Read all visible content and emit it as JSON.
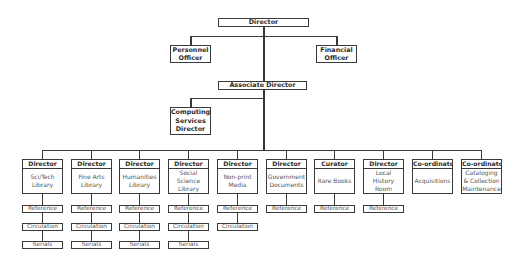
{
  "chart": {
    "top": {
      "label": "Director"
    },
    "staff": [
      {
        "id": "personnel",
        "label": "Personnel Officer"
      },
      {
        "id": "financial",
        "label": "Financial Officer"
      }
    ],
    "associate": {
      "label": "Associate Director"
    },
    "computing": {
      "label": "Computing Services Director"
    },
    "units": [
      {
        "title": "Director",
        "name": "Sci/Tech Library",
        "subs": [
          "Reference",
          "Circulation",
          "Serials"
        ]
      },
      {
        "title": "Director",
        "name": "Fine Arts Library",
        "subs": [
          "Reference",
          "Circulation",
          "Serials"
        ]
      },
      {
        "title": "Director",
        "name": "Humanities Library",
        "subs": [
          "Reference",
          "Circulation",
          "Serials"
        ]
      },
      {
        "title": "Director",
        "name": "Social Science Library",
        "subs": [
          "Reference",
          "Circulation",
          "Serials"
        ]
      },
      {
        "title": "Director",
        "name": "Non-print Media",
        "subs": [
          "Reference",
          "Circulation"
        ]
      },
      {
        "title": "Director",
        "name": "Government Documents",
        "subs": [
          "Reference"
        ]
      },
      {
        "title": "Curator",
        "name": "Rare Books",
        "subs": [
          "Reference"
        ]
      },
      {
        "title": "Director",
        "name": "Local History Room",
        "subs": [
          "Reference"
        ]
      },
      {
        "title": "Co-ordinator",
        "name": "Acquisitions",
        "subs": []
      },
      {
        "title": "Co-ordinator",
        "name": "Cataloging & Collection Maintenance",
        "subs": []
      }
    ]
  }
}
